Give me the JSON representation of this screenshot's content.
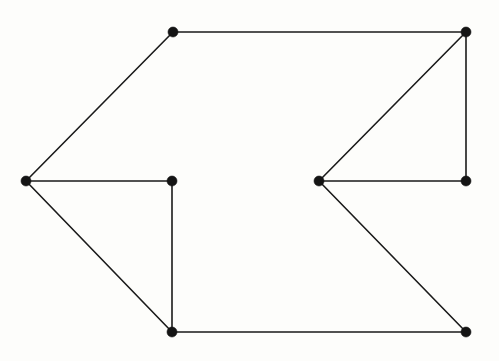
{
  "diagram": {
    "type": "node-link-graph",
    "background_color": "#fdfdfb",
    "edge_color": "#1a1a1a",
    "vertex_color": "#141414",
    "vertex_radius": 5,
    "edge_width": 1.6,
    "canvas": {
      "width": 499,
      "height": 361
    },
    "vertex_count": 8,
    "edge_count": 10,
    "vertices": [
      {
        "id": "A",
        "name": "left-apex-vertex",
        "x": 26,
        "y": 181
      },
      {
        "id": "B",
        "name": "top-left-vertex",
        "x": 173,
        "y": 32
      },
      {
        "id": "C",
        "name": "inner-left-vertex",
        "x": 172,
        "y": 181
      },
      {
        "id": "D",
        "name": "bottom-left-vertex",
        "x": 172,
        "y": 332
      },
      {
        "id": "E",
        "name": "inner-right-apex-vertex",
        "x": 319,
        "y": 181
      },
      {
        "id": "F",
        "name": "top-right-vertex",
        "x": 466,
        "y": 32
      },
      {
        "id": "G",
        "name": "right-middle-vertex",
        "x": 466,
        "y": 181
      },
      {
        "id": "H",
        "name": "bottom-right-vertex",
        "x": 466,
        "y": 332
      }
    ],
    "edges": [
      {
        "from": "A",
        "to": "B",
        "name": "edge-left-apex-to-top-left"
      },
      {
        "from": "A",
        "to": "C",
        "name": "edge-left-apex-to-inner-left"
      },
      {
        "from": "A",
        "to": "D",
        "name": "edge-left-apex-to-bottom-left"
      },
      {
        "from": "B",
        "to": "F",
        "name": "edge-top-left-to-top-right"
      },
      {
        "from": "C",
        "to": "D",
        "name": "edge-inner-left-to-bottom-left"
      },
      {
        "from": "D",
        "to": "H",
        "name": "edge-bottom-left-to-bottom-right"
      },
      {
        "from": "E",
        "to": "F",
        "name": "edge-inner-right-to-top-right"
      },
      {
        "from": "E",
        "to": "G",
        "name": "edge-inner-right-to-right-middle"
      },
      {
        "from": "E",
        "to": "H",
        "name": "edge-inner-right-to-bottom-right"
      },
      {
        "from": "F",
        "to": "G",
        "name": "edge-top-right-to-right-middle"
      }
    ]
  }
}
